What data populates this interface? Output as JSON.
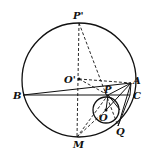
{
  "diagram": {
    "type": "geometry",
    "labels": {
      "P_prime": "P'",
      "O_prime": "O'",
      "A": "A",
      "B": "B",
      "C": "C",
      "P": "P",
      "O": "O",
      "Q": "Q",
      "M": "M"
    },
    "big_circle": {
      "cx": 79,
      "cy": 80,
      "r": 57
    },
    "small_circle": {
      "cx": 106,
      "cy": 109,
      "r": 13
    },
    "points": {
      "P_prime": [
        79,
        23
      ],
      "O_prime": [
        79,
        79
      ],
      "A": [
        131,
        83
      ],
      "B": [
        23,
        95
      ],
      "C": [
        130,
        95
      ],
      "P": [
        108,
        95
      ],
      "O": [
        106,
        110
      ],
      "Q": [
        118,
        126
      ],
      "M": [
        77,
        137
      ]
    },
    "stroke_color": "#111111"
  }
}
